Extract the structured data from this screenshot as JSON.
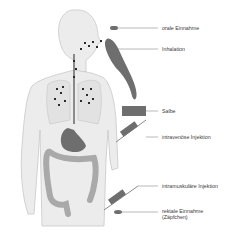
{
  "diagram": {
    "type": "anatomical-illustration",
    "labels": [
      {
        "id": "oral",
        "text": "orale Einnahme"
      },
      {
        "id": "inhalation",
        "text": "Inhalation"
      },
      {
        "id": "ointment",
        "text": "Salbe"
      },
      {
        "id": "iv",
        "text": "intravenöse Injektion"
      },
      {
        "id": "im",
        "text": "intramuskuläre Injektion"
      },
      {
        "id": "rectal_line1",
        "text": "rektale Einnahme"
      },
      {
        "id": "rectal_line2",
        "text": "(Zäpfchen)"
      }
    ],
    "colors": {
      "body_fill": "#ececec",
      "body_outline": "#c8c8c8",
      "lung_fill": "#e2e2e2",
      "organ_dark": "#6e6e6e",
      "organ_light": "#a9a9a9",
      "particles": "#2a2a2a",
      "leader_line": "#8a8a8a"
    },
    "caption": ""
  }
}
